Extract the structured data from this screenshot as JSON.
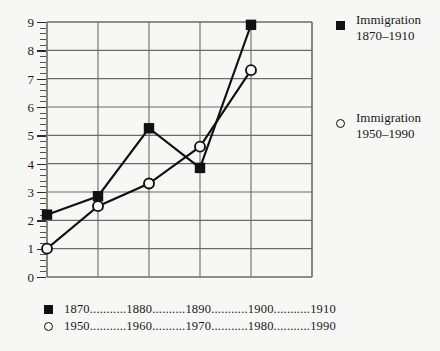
{
  "chart_data": {
    "type": "line",
    "title": "",
    "xlabel": "",
    "ylabel": "",
    "ylim": [
      0,
      9
    ],
    "grid": true,
    "legend_position": "right",
    "categories": [
      "1870",
      "1880",
      "1890",
      "1900",
      "1910"
    ],
    "categories_secondary": [
      "1950",
      "1960",
      "1970",
      "1980",
      "1990"
    ],
    "y_ticks": [
      "0",
      "1",
      "2",
      "3",
      "4",
      "5",
      "6",
      "7",
      "8",
      "9"
    ],
    "series": [
      {
        "name": "Immigration 1870–1910",
        "marker": "filled-square",
        "values": [
          2.2,
          2.85,
          5.25,
          3.85,
          8.9
        ]
      },
      {
        "name": "Immigration 1950–1990",
        "marker": "open-circle",
        "values": [
          1.0,
          2.5,
          3.3,
          4.6,
          7.3
        ]
      }
    ]
  },
  "legend": {
    "entries": [
      {
        "marker": "filled-square",
        "line1": "Immigration",
        "line2": "1870–1910"
      },
      {
        "marker": "open-circle",
        "line1": "Immigration",
        "line2": "1950–1990"
      }
    ]
  },
  "x_axis": {
    "rows": [
      {
        "marker": "filled-square",
        "text": "1870...........1880..........1890...........1900...........1910"
      },
      {
        "marker": "open-circle",
        "text": "1950...........1960..........1970...........1980...........1990"
      }
    ]
  },
  "colors": {
    "ink": "#111111",
    "grid": "#6b6b66",
    "background": "#f7f7f6"
  }
}
